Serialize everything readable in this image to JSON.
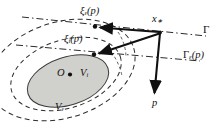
{
  "figure": {
    "background_color": "#ffffff",
    "stroke_color": "#1a1a1a",
    "inner_fill_color": "#d0d0cd",
    "dash_color": "#2b2b2b",
    "width": 218,
    "height": 131
  },
  "labels": {
    "xi_outer": {
      "base": "ξ",
      "sub": "ε",
      "arg": "(p)"
    },
    "xi_inner": {
      "base": "ξ",
      "sub": "i",
      "arg": "(p)"
    },
    "x_star": {
      "base": "x",
      "sub": "∗"
    },
    "gamma": {
      "base": "Γ"
    },
    "gamma_eps": {
      "base": "Γ",
      "sub": "ε",
      "arg": "(p)"
    },
    "origin": {
      "base": "O"
    },
    "v_inner": {
      "base": "V",
      "sub": "i"
    },
    "v_outer": {
      "base": "V",
      "sub": "ε"
    },
    "p_vector": {
      "base": "p"
    }
  },
  "geometry": {
    "inner_ellipse": {
      "cx": 68,
      "cy": 80,
      "rx": 42,
      "ry": 24,
      "rotation": -18,
      "style": "solid-filled"
    },
    "middle_ellipse": {
      "cx": 66,
      "cy": 74,
      "rx": 56,
      "ry": 34,
      "rotation": -18,
      "style": "dashed"
    },
    "outer_ellipse": {
      "cx": 62,
      "cy": 70,
      "rx": 75,
      "ry": 48,
      "rotation": -18,
      "style": "dashed"
    },
    "point_xi_outer": {
      "x": 95,
      "y": 27
    },
    "point_xi_inner": {
      "x": 94,
      "y": 54
    },
    "point_x_star": {
      "x": 160,
      "y": 32
    },
    "point_p_tip": {
      "x": 155,
      "y": 96
    },
    "point_origin": {
      "x": 69,
      "y": 73
    },
    "line_gamma": {
      "x1": 24,
      "y1": 18,
      "x2": 206,
      "y2": 35
    },
    "line_gamma_eps": {
      "x1": 18,
      "y1": 46,
      "x2": 200,
      "y2": 60
    }
  }
}
